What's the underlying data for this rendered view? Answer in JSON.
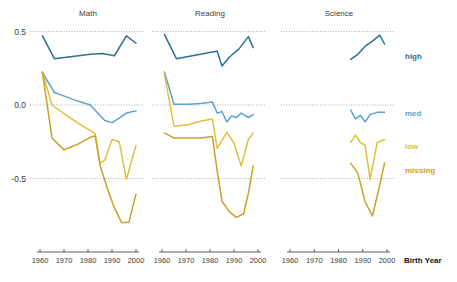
{
  "chart_data": {
    "type": "line",
    "title": "",
    "xlabel": "Birth Year",
    "ylabel": "",
    "xlim": [
      1958,
      2002
    ],
    "ylim": [
      -0.92,
      0.62
    ],
    "xticks": [
      1960,
      1970,
      1980,
      1990,
      2000
    ],
    "xticklabels": [
      "1960",
      "1970",
      "1980",
      "1990",
      "2000"
    ],
    "yticks": [
      0.5,
      0.0,
      -0.5
    ],
    "yticklabels": [
      "0.5",
      "0.0",
      "-0.5"
    ],
    "grid": true,
    "grid_axis": "y",
    "legend_position": "right",
    "panels": [
      {
        "name": "math",
        "title": "Math",
        "series": [
          {
            "name": "high",
            "color": "#2e7096",
            "x": [
              1961,
              1966,
              1971,
              1976,
              1981,
              1986,
              1991,
              1996,
              2000
            ],
            "y": [
              0.47,
              0.315,
              0.325,
              0.335,
              0.345,
              0.35,
              0.335,
              0.47,
              0.42
            ]
          },
          {
            "name": "med",
            "color": "#5ba3cf",
            "x": [
              1961,
              1966,
              1971,
              1976,
              1981,
              1984,
              1987,
              1990,
              1993,
              1996,
              2000
            ],
            "y": [
              0.22,
              0.085,
              0.055,
              0.025,
              0.0,
              -0.055,
              -0.105,
              -0.12,
              -0.09,
              -0.055,
              -0.04
            ]
          },
          {
            "name": "low",
            "color": "#e0c043",
            "x": [
              1961,
              1965,
              1971,
              1976,
              1981,
              1983,
              1985,
              1987,
              1990,
              1993,
              1996,
              2000
            ],
            "y": [
              0.225,
              0.0,
              -0.07,
              -0.125,
              -0.175,
              -0.195,
              -0.395,
              -0.375,
              -0.235,
              -0.25,
              -0.505,
              -0.275
            ]
          },
          {
            "name": "missing",
            "color": "#c9a227",
            "x": [
              1961,
              1965,
              1970,
              1976,
              1981,
              1983,
              1985,
              1988,
              1991,
              1994,
              1997,
              2000
            ],
            "y": [
              0.225,
              -0.225,
              -0.305,
              -0.265,
              -0.22,
              -0.21,
              -0.41,
              -0.565,
              -0.7,
              -0.8,
              -0.8,
              -0.605
            ]
          }
        ]
      },
      {
        "name": "reading",
        "title": "Reading",
        "series": [
          {
            "name": "high",
            "color": "#2e7096",
            "x": [
              1961,
              1966,
              1971,
              1976,
              1981,
              1983,
              1985,
              1988,
              1992,
              1996,
              1998
            ],
            "y": [
              0.48,
              0.315,
              0.33,
              0.345,
              0.36,
              0.365,
              0.265,
              0.325,
              0.38,
              0.465,
              0.39
            ]
          },
          {
            "name": "med",
            "color": "#5ba3cf",
            "x": [
              1961,
              1965,
              1971,
              1976,
              1981,
              1983,
              1985,
              1987,
              1989,
              1991,
              1993,
              1996,
              1998
            ],
            "y": [
              0.225,
              0.005,
              0.005,
              0.01,
              0.02,
              -0.055,
              -0.045,
              -0.115,
              -0.075,
              -0.085,
              -0.055,
              -0.085,
              -0.065
            ]
          },
          {
            "name": "low",
            "color": "#e0c043",
            "x": [
              1961,
              1965,
              1971,
              1976,
              1981,
              1983,
              1985,
              1987,
              1990,
              1993,
              1996,
              1998
            ],
            "y": [
              0.21,
              -0.145,
              -0.135,
              -0.11,
              -0.095,
              -0.295,
              -0.24,
              -0.185,
              -0.26,
              -0.415,
              -0.235,
              -0.19
            ]
          },
          {
            "name": "missing",
            "color": "#c9a227",
            "x": [
              1961,
              1965,
              1970,
              1976,
              1981,
              1983,
              1985,
              1988,
              1991,
              1994,
              1996,
              1998
            ],
            "y": [
              -0.19,
              -0.225,
              -0.225,
              -0.225,
              -0.215,
              -0.45,
              -0.655,
              -0.725,
              -0.765,
              -0.74,
              -0.6,
              -0.415
            ]
          }
        ]
      },
      {
        "name": "science",
        "title": "Science",
        "series": [
          {
            "name": "high",
            "color": "#2e7096",
            "x": [
              1985,
              1988,
              1991,
              1994,
              1997,
              1999
            ],
            "y": [
              0.31,
              0.345,
              0.4,
              0.435,
              0.475,
              0.415
            ]
          },
          {
            "name": "med",
            "color": "#5ba3cf",
            "x": [
              1985,
              1987,
              1989,
              1991,
              1993,
              1996,
              1999
            ],
            "y": [
              -0.035,
              -0.095,
              -0.07,
              -0.115,
              -0.065,
              -0.05,
              -0.05
            ]
          },
          {
            "name": "low",
            "color": "#e0c043",
            "x": [
              1985,
              1987,
              1989,
              1991,
              1993,
              1996,
              1999
            ],
            "y": [
              -0.255,
              -0.205,
              -0.255,
              -0.275,
              -0.505,
              -0.255,
              -0.235
            ]
          },
          {
            "name": "missing",
            "color": "#c9a227",
            "x": [
              1985,
              1988,
              1991,
              1994,
              1997,
              1999
            ],
            "y": [
              -0.395,
              -0.465,
              -0.66,
              -0.755,
              -0.545,
              -0.395
            ]
          }
        ]
      }
    ],
    "legend": [
      {
        "label": "high",
        "color": "#2e7096",
        "y_value": 0.33
      },
      {
        "label": "med",
        "color": "#5ba3cf",
        "y_value": -0.055
      },
      {
        "label": "low",
        "color": "#e0c043",
        "y_value": -0.28
      },
      {
        "label": "missing",
        "color": "#c9a227",
        "y_value": -0.44
      }
    ],
    "colors": {
      "high": "#2e7096",
      "med": "#5ba3cf",
      "low": "#e0c043",
      "missing": "#c9a227",
      "grid": "#9a9a9a",
      "axis": "#4a4a4a",
      "text": "#3b3b3b",
      "background": "#ffffff"
    }
  }
}
